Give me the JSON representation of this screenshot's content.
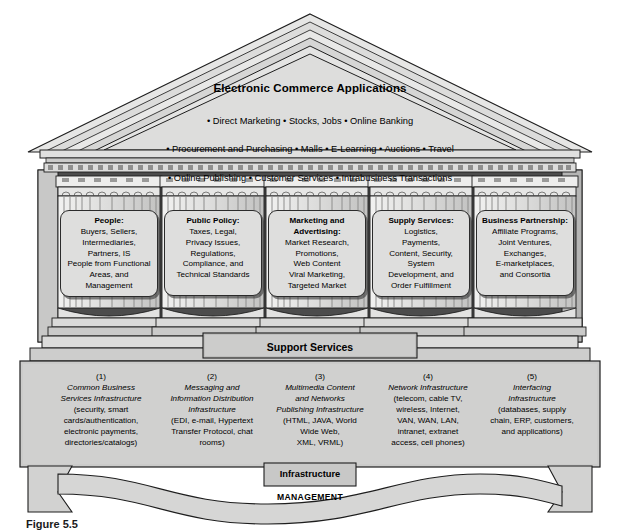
{
  "figure": {
    "caption": "Figure 5.5"
  },
  "pediment": {
    "title": "Electronic Commerce Applications",
    "lines": [
      "• Direct Marketing • Stocks, Jobs • Online Banking",
      "• Procurement and Purchasing • Malls • E-Learning • Auctions • Travel",
      "• Online Publishing • Customer Services • Intrabusiness Transactions"
    ]
  },
  "pillars": [
    {
      "heading": "People:",
      "body": "Buyers, Sellers,\nIntermediaries,\nPartners, IS\nPeople from Functional\nAreas, and\nManagement"
    },
    {
      "heading": "Public Policy:",
      "body": "Taxes, Legal,\nPrivacy Issues,\nRegulations,\nCompliance, and\nTechnical Standards"
    },
    {
      "heading": "Marketing and\nAdvertising:",
      "body": "Market Research,\nPromotions,\nWeb Content\nViral Marketing,\nTargeted Market"
    },
    {
      "heading": "Supply Services:",
      "body": "Logistics,\nPayments,\nContent, Security,\nSystem\nDevelopment, and\nOrder Fulfillment"
    },
    {
      "heading": "Business\nPartnership:",
      "body": "Affiliate Programs,\nJoint Ventures,\nExchanges,\nE-marketplaces,\nand Consortia"
    }
  ],
  "support": {
    "label": "Support Services"
  },
  "infrastructure": {
    "label": "Infrastructure",
    "columns": [
      {
        "number": "(1)",
        "title": "Common Business\nServices Infrastructure",
        "detail": "(security, smart\ncards/authentication,\nelectronic payments,\ndirectories/catalogs)"
      },
      {
        "number": "(2)",
        "title": "Messaging and\nInformation Distribution\nInfrastructure",
        "detail": "(EDI, e-mail, Hypertext\nTransfer Protocol, chat\nrooms)"
      },
      {
        "number": "(3)",
        "title": "Multimedia Content\nand Networks\nPublishing Infrastructure",
        "detail": "(HTML, JAVA, World\nWide Web,\nXML, VRML)"
      },
      {
        "number": "(4)",
        "title": "Network Infrastructure",
        "detail": "(telecom, cable TV,\nwireless, Internet,\nVAN, WAN, LAN,\nintranet, extranet\naccess, cell phones)"
      },
      {
        "number": "(5)",
        "title": "Interfacing\nInfrastructure",
        "detail": "(databases, supply\nchain, ERP, customers,\nand applications)"
      }
    ]
  },
  "management": {
    "label": "MANAGEMENT"
  },
  "colors": {
    "page_background": "#ffffff",
    "stone_light": "#e3e3e2",
    "stone_mid": "#d2d2d1",
    "stone_dark": "#bdbdbc",
    "shadow_dark": "#3a3a3a",
    "outline": "#1e1e1e"
  }
}
